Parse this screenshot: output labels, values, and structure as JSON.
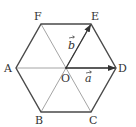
{
  "diagram": {
    "type": "regular-hexagon",
    "center": {
      "label": "O",
      "x": 66,
      "y": 68
    },
    "vertices": [
      {
        "label": "A",
        "x": 16,
        "y": 68
      },
      {
        "label": "B",
        "x": 41,
        "y": 112
      },
      {
        "label": "C",
        "x": 91,
        "y": 112
      },
      {
        "label": "D",
        "x": 116,
        "y": 68
      },
      {
        "label": "E",
        "x": 91,
        "y": 24
      },
      {
        "label": "F",
        "x": 41,
        "y": 24
      }
    ],
    "diagonals": [
      "AD",
      "BE",
      "CF"
    ],
    "vectors": [
      {
        "name": "a",
        "from": "O",
        "to": "D",
        "label": "a"
      },
      {
        "name": "b",
        "from": "O",
        "to": "E",
        "label": "b"
      }
    ],
    "colors": {
      "outline": "#4a4a4a",
      "diagonal": "#9a9a9a",
      "vector": "#333333",
      "text": "#333333"
    }
  },
  "labels": {
    "A": "A",
    "B": "B",
    "C": "C",
    "D": "D",
    "E": "E",
    "F": "F",
    "O": "O",
    "a": "a",
    "b": "b"
  }
}
